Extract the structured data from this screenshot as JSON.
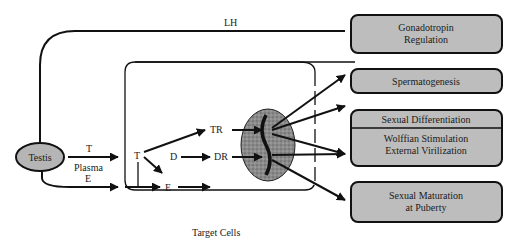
{
  "diagram": {
    "feedback_label": "LH",
    "source": {
      "label": "Testis"
    },
    "compartments": {
      "plasma": "Plasma",
      "target_cells": "Target Cells"
    },
    "plasma_hormones": {
      "testosterone": "T",
      "estrogen": "E"
    },
    "intracellular": {
      "testosterone": "T",
      "dht": "D",
      "estrogen": "E",
      "testosterone_receptor": "TR",
      "dht_receptor": "DR"
    },
    "outcomes": [
      {
        "lines": [
          "Gonadotropin",
          "Regulation"
        ]
      },
      {
        "lines": [
          "Spermatogenesis"
        ]
      },
      {
        "lines": [
          "Sexual Differentiation"
        ]
      },
      {
        "lines": [
          "Wolffian Stimulation",
          "External Virilization"
        ]
      },
      {
        "lines": [
          "Sexual Maturation",
          "at Puberty"
        ]
      }
    ],
    "colors": {
      "box_fill": "#bdbdbd",
      "testis_fill": "#b5b5b5",
      "nucleus_fill": "#8a8a8a",
      "stroke": "#111111"
    }
  }
}
